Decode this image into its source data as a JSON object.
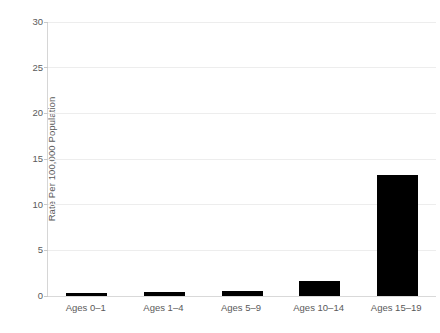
{
  "chart_data": {
    "type": "bar",
    "title": "",
    "subtitle": "",
    "xlabel": "",
    "ylabel": "Rate Per 100,000 Population",
    "categories": [
      "Ages 0–1",
      "Ages 1–4",
      "Ages 5–9",
      "Ages 10–14",
      "Ages 15–19"
    ],
    "values": [
      0.3,
      0.45,
      0.55,
      1.6,
      13.2
    ],
    "ylim": [
      0,
      30
    ],
    "yticks": [
      0,
      5,
      10,
      15,
      20,
      25,
      30
    ],
    "ytick_labels": [
      "0",
      "5",
      "10",
      "15",
      "20",
      "25",
      "30"
    ],
    "grid": true,
    "grid_axis": "y",
    "legend": false,
    "legend_position": "none",
    "bar_color": "#000000",
    "grid_color": "#ededed",
    "axis_color": "#d6d6d6",
    "text_color": "#5a5a5a",
    "background_color": "#ffffff"
  }
}
